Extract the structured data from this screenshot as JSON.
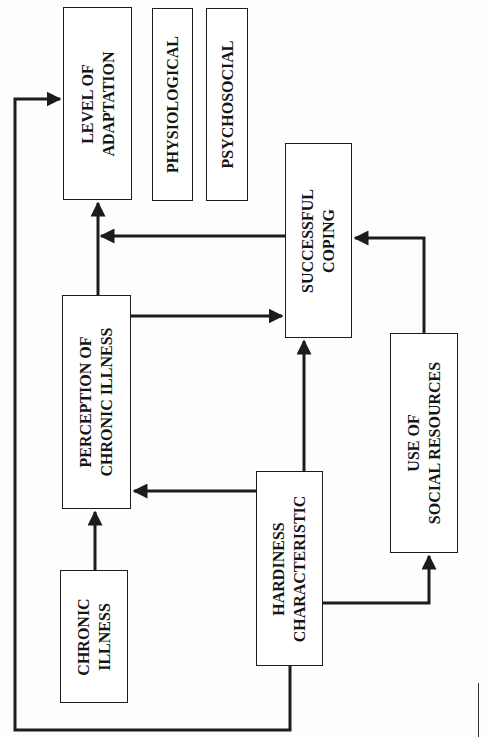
{
  "diagram": {
    "orientation": "rotated-90-ccw",
    "nodes": [
      {
        "id": "level_of_adaptation",
        "lines": [
          "LEVEL OF",
          "ADAPTATION"
        ]
      },
      {
        "id": "physiological",
        "lines": [
          "PHYSIOLOGICAL"
        ]
      },
      {
        "id": "psychosocial",
        "lines": [
          "PSYCHOSOCIAL"
        ]
      },
      {
        "id": "successful_coping",
        "lines": [
          "SUCCESSFUL",
          "COPING"
        ]
      },
      {
        "id": "perception_of_chronic_illness",
        "lines": [
          "PERCEPTION OF",
          "CHRONIC ILLNESS"
        ]
      },
      {
        "id": "chronic_illness",
        "lines": [
          "CHRONIC",
          "ILLNESS"
        ]
      },
      {
        "id": "hardiness_characteristic",
        "lines": [
          "HARDINESS",
          "CHARACTERISTIC"
        ]
      },
      {
        "id": "use_of_social_resources",
        "lines": [
          "USE OF",
          "SOCIAL RESOURCES"
        ]
      }
    ],
    "edges": [
      {
        "from": "chronic_illness",
        "to": "perception_of_chronic_illness"
      },
      {
        "from": "perception_of_chronic_illness",
        "to": "level_of_adaptation"
      },
      {
        "from": "perception_of_chronic_illness",
        "to": "successful_coping"
      },
      {
        "from": "hardiness_characteristic",
        "to": "perception_of_chronic_illness"
      },
      {
        "from": "hardiness_characteristic",
        "to": "successful_coping"
      },
      {
        "from": "hardiness_characteristic",
        "to": "use_of_social_resources"
      },
      {
        "from": "hardiness_characteristic",
        "to": "level_of_adaptation"
      },
      {
        "from": "use_of_social_resources",
        "to": "successful_coping"
      },
      {
        "from": "successful_coping",
        "to": "level_of_adaptation"
      }
    ],
    "stroke_color": "#1c1c1c",
    "background_color": "#ffffff"
  }
}
